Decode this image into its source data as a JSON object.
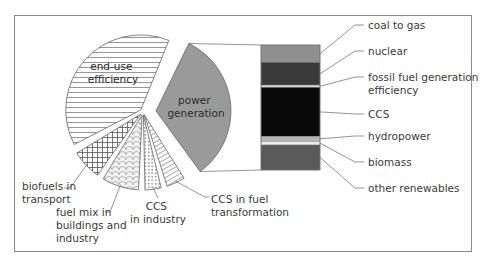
{
  "chart_data": {
    "type": "pie",
    "title": "",
    "pie": {
      "units": "percent of total",
      "slices": [
        {
          "name": "end-use efficiency",
          "value": 39,
          "pattern": "horizontal-lines",
          "label_position": "inside",
          "exploded": false
        },
        {
          "name": "power generation",
          "value": 33,
          "pattern": "solid",
          "color": "#9a9a9a",
          "label_position": "inside",
          "exploded": true
        },
        {
          "name": "CCS in fuel transformation",
          "value": 4,
          "pattern": "diagonal-hatch",
          "label_position": "outside",
          "exploded": false
        },
        {
          "name": "CCS in industry",
          "value": 3.5,
          "pattern": "dots",
          "label_position": "outside",
          "exploded": false
        },
        {
          "name": "fuel mix in buildings and industry",
          "value": 8,
          "pattern": "scales",
          "label_position": "outside",
          "exploded": false
        },
        {
          "name": "biofuels in transport",
          "value": 6.5,
          "pattern": "crosshatch",
          "label_position": "outside",
          "exploded": false
        }
      ]
    },
    "breakdown_bar": {
      "of_slice": "power generation",
      "units": "percent of power generation",
      "segments": [
        {
          "name": "coal to gas",
          "value": 14,
          "color": "#8f8f8f"
        },
        {
          "name": "nuclear",
          "value": 18,
          "color": "#3a3a3a"
        },
        {
          "name": "fossil fuel generation efficiency",
          "value": 2,
          "color": "#d4d4d4"
        },
        {
          "name": "CCS",
          "value": 39,
          "color": "#0a0a0a"
        },
        {
          "name": "hydropower",
          "value": 4,
          "color": "#b5b5b5"
        },
        {
          "name": "biomass",
          "value": 3,
          "color": "#ececec"
        },
        {
          "name": "other renewables",
          "value": 20,
          "color": "#5a5a5a"
        }
      ]
    },
    "legend": "none"
  },
  "labels": {
    "end_use": [
      "end-use",
      "efficiency"
    ],
    "power": [
      "power",
      "generation"
    ],
    "biofuels": [
      "biofuels in",
      "transport"
    ],
    "fuel_mix": [
      "fuel mix in",
      "buildings and",
      "industry"
    ],
    "ccs_industry": [
      "CCS",
      "in industry"
    ],
    "ccs_fuel": [
      "CCS in fuel",
      "transformation"
    ],
    "bar": {
      "coal_to_gas": [
        "coal to gas"
      ],
      "nuclear": [
        "nuclear"
      ],
      "fossil": [
        "fossil fuel generation",
        "efficiency"
      ],
      "ccs": [
        "CCS"
      ],
      "hydropower": [
        "hydropower"
      ],
      "biomass": [
        "biomass"
      ],
      "other_renewables": [
        "other renewables"
      ]
    }
  }
}
